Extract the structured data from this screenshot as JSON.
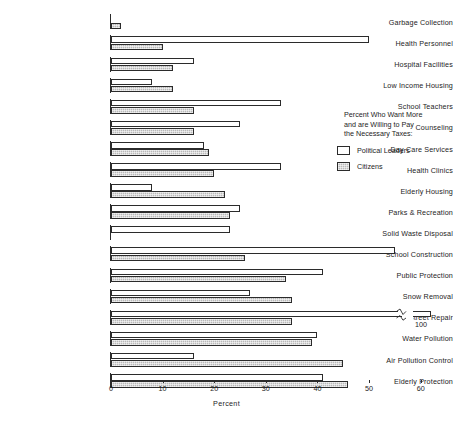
{
  "chart_data": {
    "type": "bar",
    "orientation": "horizontal",
    "title": "",
    "xlabel": "Percent",
    "ylabel": "",
    "xlim": [
      0,
      62
    ],
    "xticks": [
      0,
      10,
      20,
      30,
      40,
      50,
      60
    ],
    "xticklabels": [
      "0",
      "10",
      "20",
      "30",
      "40",
      "50",
      "60"
    ],
    "grid": false,
    "legend_position": "right",
    "legend_title_lines": [
      "Percent Who Want More",
      "and are Willing to Pay",
      "the Necessary Taxes:"
    ],
    "categories": [
      "Garbage Collection",
      "Health Personnel",
      "Hospital Facilities",
      "Low Income Housing",
      "School Teachers",
      "Counseling",
      "Day Care Services",
      "Health Clinics",
      "Elderly Housing",
      "Parks & Recreation",
      "Solid Waste Disposal",
      "School Construction",
      "Public Protection",
      "Snow Removal",
      "Street Repair",
      "Water Pollution",
      "Air Pollution Control",
      "Elderly Protection"
    ],
    "series": [
      {
        "name": "Political Leaders",
        "fill": "white",
        "values": [
          0,
          50,
          16,
          8,
          33,
          25,
          18,
          33,
          8,
          25,
          23,
          55,
          41,
          27,
          100,
          40,
          16,
          41
        ]
      },
      {
        "name": "Citizens",
        "fill": "hatched-gray",
        "values": [
          2,
          10,
          12,
          12,
          16,
          16,
          19,
          20,
          22,
          23,
          0,
          26,
          34,
          35,
          35,
          39,
          45,
          46
        ]
      }
    ],
    "annotations": [
      {
        "text": "100",
        "series": "Political Leaders",
        "category": "Street Repair",
        "note": "bar is broken (axis break) and extends to 100"
      }
    ],
    "colors": {
      "leaders_fill": "#ffffff",
      "citizens_fill": "#b8b8b8",
      "outline": "#2b2b2b",
      "text": "#1d1d1d",
      "background": "#ffffff"
    }
  },
  "axis": {
    "title": "Percent"
  },
  "legend": {
    "entries": [
      {
        "label": "Political Leaders",
        "swatch": "white-box-swatch"
      },
      {
        "label": "Citizens",
        "swatch": "gray-hatched-box-swatch"
      }
    ]
  }
}
